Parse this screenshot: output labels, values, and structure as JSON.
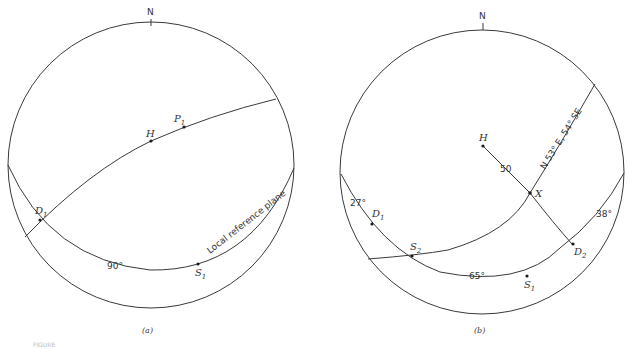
{
  "figure_caption_fragment": "FIGURE",
  "panel_a": {
    "caption": "(a)",
    "north_label": "N",
    "points": {
      "H": "H",
      "P1": "P",
      "P1_sub": "1",
      "D1": "D",
      "D1_sub": "1",
      "S1": "S",
      "S1_sub": "1"
    },
    "angle_label": "90°",
    "plane_label": "Local reference plane"
  },
  "panel_b": {
    "caption": "(b)",
    "north_label": "N",
    "points": {
      "H": "H",
      "X": "X",
      "D1": "D",
      "D1_sub": "1",
      "D2": "D",
      "D2_sub": "2",
      "S1": "S",
      "S1_sub": "1",
      "S2": "S",
      "S2_sub": "2"
    },
    "angle_labels": {
      "left": "27°",
      "bottom": "65°",
      "right": "38°"
    },
    "distance_label": "50",
    "plane_label": "N 53° E, 54° SE"
  }
}
